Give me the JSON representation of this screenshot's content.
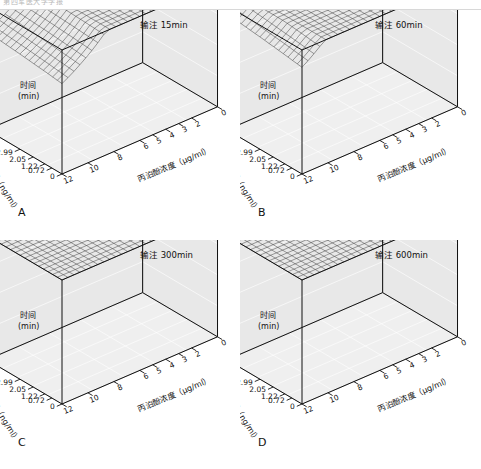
{
  "figure": {
    "header_text": "第四军医大学学报",
    "background": "#ffffff",
    "ink": "#111111",
    "panel_fill": "#e8e8e8",
    "floor_fill": "#efefef",
    "mesh_color": "#2a2a2a"
  },
  "axes": {
    "z": {
      "title_line1": "时间",
      "title_line2": "(min)",
      "ticks": [
        "40",
        "30",
        "20",
        "10",
        "0"
      ],
      "values": [
        40,
        30,
        20,
        10,
        0
      ],
      "range": [
        0,
        40
      ],
      "unit": "min"
    },
    "x": {
      "title": "丙泊酚浓度（μg/ml）",
      "ticks": [
        "12",
        "10",
        "8",
        "6",
        "5",
        "4",
        "3",
        "2",
        "0"
      ],
      "values": [
        12,
        10,
        8,
        6,
        5,
        4,
        3,
        2,
        0
      ],
      "range": [
        0,
        12
      ],
      "unit": "μg/ml"
    },
    "y": {
      "title": "芬太尼浓度（ng/ml）",
      "ticks": [
        "0",
        "0.72",
        "1.22",
        "2.05",
        "2.99",
        "5.33"
      ],
      "values": [
        0,
        0.72,
        1.22,
        2.05,
        2.99,
        5.33
      ],
      "range": [
        0,
        5.33
      ],
      "unit": "ng/ml"
    }
  },
  "panels": [
    {
      "id": "A",
      "letter": "A",
      "title": "输注 15min",
      "infusion_minutes": 15
    },
    {
      "id": "B",
      "letter": "B",
      "title": "输注 60min",
      "infusion_minutes": 60
    },
    {
      "id": "C",
      "letter": "C",
      "title": "输注 300min",
      "infusion_minutes": 300
    },
    {
      "id": "D",
      "letter": "D",
      "title": "输注 600min",
      "infusion_minutes": 600
    }
  ],
  "chart_data": {
    "type": "line",
    "subtype": "3d-wireframe-surface",
    "xlabel": "丙泊酚浓度（μg/ml）",
    "ylabel": "芬太尼浓度（ng/ml）",
    "zlabel": "时间（min）",
    "xlim": [
      0,
      12
    ],
    "ylim": [
      0,
      5.33
    ],
    "zlim": [
      0,
      40
    ],
    "grid": true,
    "legend": "none",
    "x": [
      0,
      2,
      3,
      4,
      5,
      6,
      8,
      10,
      12
    ],
    "y": [
      0,
      0.72,
      1.22,
      2.05,
      2.99,
      5.33
    ],
    "series": [
      {
        "name": "输注 15min",
        "panel": "A",
        "z_at_y0": [
          40,
          40,
          38,
          26,
          16,
          10,
          5,
          3,
          2
        ],
        "z_at_y0.72": [
          40,
          40,
          36,
          23,
          14,
          9,
          4,
          2,
          1
        ],
        "z_at_y1.22": [
          40,
          39,
          33,
          20,
          12,
          7,
          3,
          2,
          1
        ],
        "z_at_y2.05": [
          40,
          38,
          30,
          17,
          10,
          6,
          3,
          1,
          1
        ],
        "z_at_y2.99": [
          40,
          36,
          27,
          14,
          8,
          5,
          2,
          1,
          0
        ],
        "z_at_y5.33": [
          40,
          33,
          22,
          11,
          6,
          4,
          2,
          1,
          0
        ]
      },
      {
        "name": "输注 60min",
        "panel": "B",
        "z_at_y0": [
          40,
          40,
          39,
          29,
          19,
          12,
          6,
          4,
          3
        ],
        "z_at_y0.72": [
          40,
          40,
          37,
          26,
          17,
          11,
          5,
          3,
          2
        ],
        "z_at_y1.22": [
          40,
          40,
          35,
          23,
          15,
          9,
          4,
          3,
          2
        ],
        "z_at_y2.05": [
          40,
          39,
          32,
          20,
          13,
          8,
          4,
          2,
          1
        ],
        "z_at_y2.99": [
          40,
          38,
          29,
          17,
          11,
          6,
          3,
          2,
          1
        ],
        "z_at_y5.33": [
          40,
          35,
          24,
          13,
          8,
          5,
          2,
          1,
          1
        ]
      },
      {
        "name": "输注 300min",
        "panel": "C",
        "z_at_y0": [
          40,
          40,
          40,
          33,
          23,
          15,
          8,
          5,
          4
        ],
        "z_at_y0.72": [
          40,
          40,
          39,
          30,
          21,
          13,
          7,
          4,
          3
        ],
        "z_at_y1.22": [
          40,
          40,
          37,
          27,
          18,
          12,
          6,
          4,
          3
        ],
        "z_at_y2.05": [
          40,
          40,
          35,
          24,
          16,
          10,
          5,
          3,
          2
        ],
        "z_at_y2.99": [
          40,
          39,
          32,
          21,
          13,
          8,
          4,
          2,
          2
        ],
        "z_at_y5.33": [
          40,
          37,
          27,
          16,
          10,
          6,
          3,
          2,
          1
        ]
      },
      {
        "name": "输注 600min",
        "panel": "D",
        "z_at_y0": [
          40,
          40,
          40,
          35,
          25,
          17,
          9,
          6,
          5
        ],
        "z_at_y0.72": [
          40,
          40,
          40,
          32,
          23,
          15,
          8,
          5,
          4
        ],
        "z_at_y1.22": [
          40,
          40,
          38,
          29,
          20,
          13,
          7,
          4,
          3
        ],
        "z_at_y2.05": [
          40,
          40,
          36,
          26,
          18,
          11,
          6,
          4,
          3
        ],
        "z_at_y2.99": [
          40,
          40,
          34,
          23,
          15,
          9,
          5,
          3,
          2
        ],
        "z_at_y5.33": [
          40,
          38,
          29,
          18,
          11,
          7,
          3,
          2,
          1
        ]
      }
    ]
  }
}
